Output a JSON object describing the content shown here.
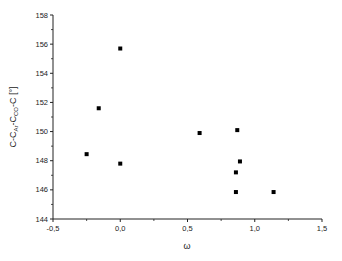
{
  "chart_data": {
    "type": "scatter",
    "title": "",
    "xlabel": "ω",
    "ylabel": "C-C_Ar-C_CO-C [°]",
    "ylabel_parts": {
      "p1": "C-C",
      "s1": "Ar",
      "p2": "-C",
      "s2": "CO",
      "p3": "-C [°]"
    },
    "xlim": [
      -0.5,
      1.5
    ],
    "ylim": [
      144,
      158
    ],
    "xticks": [
      -0.5,
      0.0,
      0.5,
      1.0,
      1.5
    ],
    "xtick_labels": [
      "-0,5",
      "0,0",
      "0,5",
      "1,0",
      "1,5"
    ],
    "yticks": [
      144,
      146,
      148,
      150,
      152,
      154,
      156,
      158
    ],
    "ytick_labels": [
      "144",
      "146",
      "148",
      "150",
      "152",
      "154",
      "156",
      "158"
    ],
    "grid": false,
    "legend": null,
    "marker": "square",
    "marker_color": "#000000",
    "series": [
      {
        "name": "data",
        "points": [
          {
            "x": 0.0,
            "y": 155.7
          },
          {
            "x": -0.16,
            "y": 151.6
          },
          {
            "x": -0.25,
            "y": 148.45
          },
          {
            "x": 0.0,
            "y": 147.8
          },
          {
            "x": 0.59,
            "y": 149.9
          },
          {
            "x": 0.87,
            "y": 150.1
          },
          {
            "x": 0.89,
            "y": 147.95
          },
          {
            "x": 0.86,
            "y": 147.2
          },
          {
            "x": 0.86,
            "y": 145.85
          },
          {
            "x": 1.14,
            "y": 145.85
          }
        ]
      }
    ]
  }
}
